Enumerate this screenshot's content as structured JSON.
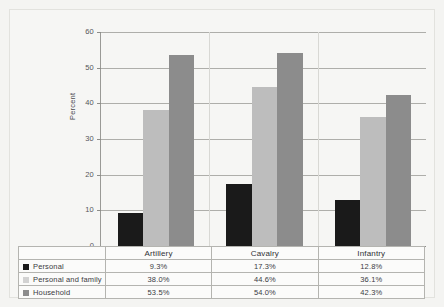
{
  "chart_data": {
    "type": "bar",
    "title": "",
    "subtitle": "",
    "xlabel": "",
    "ylabel": "Percent",
    "ylim": [
      0,
      60
    ],
    "yticks": [
      0,
      10,
      20,
      30,
      40,
      50,
      60
    ],
    "ytick_labels": [
      "0",
      "10",
      "20",
      "30",
      "40",
      "50",
      "60"
    ],
    "grid": true,
    "legend_position": "bottom-table",
    "categories": [
      "Artillery",
      "Cavalry",
      "Infantry"
    ],
    "series": [
      {
        "name": "Personal",
        "color": "#1a1a1a",
        "values": [
          9.3,
          17.3,
          12.8
        ],
        "labels": [
          "9.3%",
          "17.3%",
          "12.8%"
        ]
      },
      {
        "name": "Personal and family",
        "color": "#bdbdbd",
        "values": [
          38.0,
          44.6,
          36.1
        ],
        "labels": [
          "38.0%",
          "44.6%",
          "36.1%"
        ]
      },
      {
        "name": "Household",
        "color": "#8c8c8c",
        "values": [
          53.5,
          54.0,
          42.3
        ],
        "labels": [
          "53.5%",
          "54.0%",
          "42.3%"
        ]
      }
    ]
  },
  "table": {
    "corner_label": "",
    "column_headers": [
      "Artillery",
      "Cavalry",
      "Infantry"
    ],
    "rows": [
      {
        "label": "Personal",
        "swatch": "#1a1a1a",
        "cells": [
          "9.3%",
          "17.3%",
          "12.8%"
        ]
      },
      {
        "label": "Personal and family",
        "swatch": "#d2d2d2",
        "cells": [
          "38.0%",
          "44.6%",
          "36.1%"
        ]
      },
      {
        "label": "Household",
        "swatch": "#8c8c8c",
        "cells": [
          "53.5%",
          "54.0%",
          "42.3%"
        ]
      }
    ]
  },
  "colors": {
    "page_background": "#f4f4f2",
    "plot_background": "#f6f6f4",
    "gridline": "#aeaeaa",
    "axis": "#8d8d89",
    "text": "#3a3a3f"
  }
}
